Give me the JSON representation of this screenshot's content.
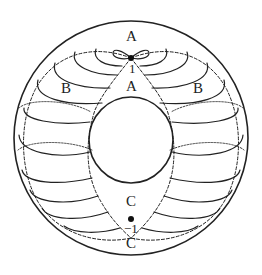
{
  "diagram": {
    "type": "torus-foliation-figure",
    "labels": {
      "top_outer": "A",
      "top_inner": "A",
      "left": "B",
      "right": "B",
      "bottom_inner": "C",
      "bottom_outer": "C",
      "top_point": "1",
      "bottom_point": "−1"
    },
    "colors": {
      "stroke": "#222222",
      "background": "#ffffff"
    }
  }
}
